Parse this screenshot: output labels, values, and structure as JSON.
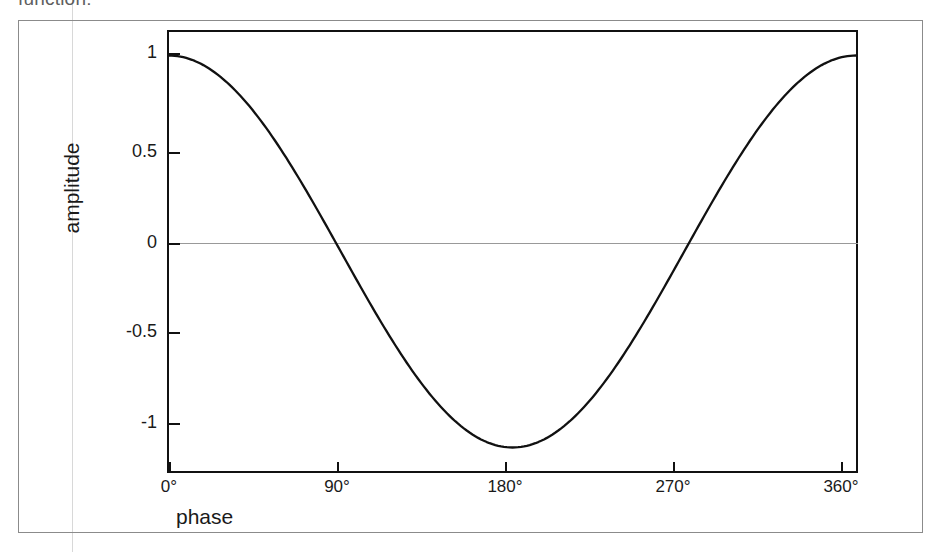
{
  "page": {
    "clipped_caption": "function:",
    "background_color": "#ffffff",
    "ink_color": "#111111",
    "border_color": "#8b8b8b",
    "zero_line_color": "#999999"
  },
  "axes": {
    "y_title": "amplitude",
    "x_title": "phase",
    "y_ticks": [
      {
        "label": "1",
        "value": 1,
        "px": 53
      },
      {
        "label": "0.5",
        "value": 0.5,
        "px": 152
      },
      {
        "label": "0",
        "value": 0,
        "px": 243
      },
      {
        "label": "-0.5",
        "value": -0.5,
        "px": 332
      },
      {
        "label": "-1",
        "value": -1,
        "px": 423
      }
    ],
    "x_ticks": [
      {
        "label": "0°",
        "value": 0,
        "px": 169
      },
      {
        "label": "90°",
        "value": 90,
        "px": 337
      },
      {
        "label": "180°",
        "value": 180,
        "px": 505
      },
      {
        "label": "270°",
        "value": 270,
        "px": 673
      },
      {
        "label": "360°",
        "value": 360,
        "px": 841
      }
    ]
  },
  "chart_data": {
    "type": "line",
    "title": "",
    "subtitle": "",
    "xlabel": "phase",
    "ylabel": "amplitude",
    "xlim": [
      0,
      360
    ],
    "ylim": [
      -1.12,
      1.12
    ],
    "grid": false,
    "legend": null,
    "xtick_labels": [
      "0°",
      "90°",
      "180°",
      "270°",
      "360°"
    ],
    "xtick_values": [
      0,
      90,
      180,
      270,
      360
    ],
    "ytick_labels": [
      "1",
      "0.5",
      "0",
      "-0.5",
      "-1"
    ],
    "ytick_values": [
      1,
      0.5,
      0,
      -0.5,
      -1
    ],
    "annotations": [
      {
        "text": "zero reference line",
        "type": "hline",
        "y": 0
      }
    ],
    "series": [
      {
        "name": "cosine",
        "function": "cos(phase)",
        "color": "#111111",
        "linewidth": 2.2,
        "x": [
          0,
          10,
          20,
          30,
          40,
          50,
          60,
          70,
          80,
          90,
          100,
          110,
          120,
          130,
          140,
          150,
          160,
          170,
          180,
          190,
          200,
          210,
          220,
          230,
          240,
          250,
          260,
          270,
          280,
          290,
          300,
          310,
          320,
          330,
          340,
          350,
          360
        ],
        "values": [
          1.0,
          0.985,
          0.94,
          0.866,
          0.766,
          0.643,
          0.5,
          0.342,
          0.174,
          0.0,
          -0.174,
          -0.342,
          -0.5,
          -0.643,
          -0.766,
          -0.866,
          -0.94,
          -0.985,
          -1.0,
          -0.985,
          -0.94,
          -0.866,
          -0.766,
          -0.643,
          -0.5,
          -0.342,
          -0.174,
          0.0,
          0.174,
          0.342,
          0.5,
          0.643,
          0.766,
          0.866,
          0.94,
          0.985,
          1.0
        ]
      }
    ]
  }
}
